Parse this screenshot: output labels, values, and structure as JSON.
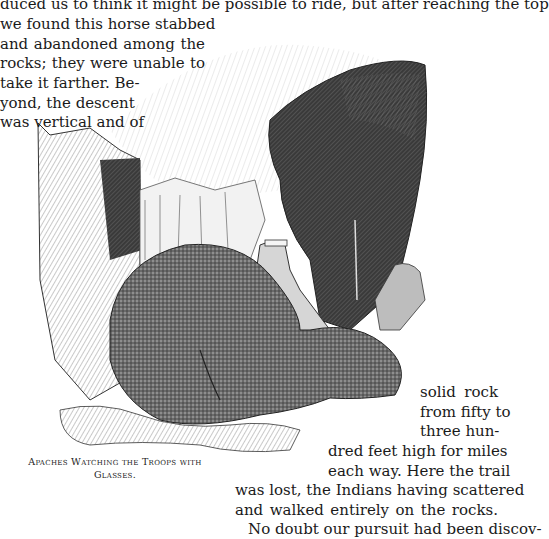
{
  "page": {
    "text_lines": [
      {
        "text": "duced us to think it might be possible to ride, but after reaching the top",
        "x": 0,
        "y": -6,
        "w": 498
      },
      {
        "text": "we found this horse stabbed",
        "x": 0,
        "y": 14,
        "w": 205
      },
      {
        "text": "and abandoned among the",
        "x": 0,
        "y": 34,
        "w": 205
      },
      {
        "text": "rocks; they were unable to",
        "x": 0,
        "y": 53,
        "w": 205
      },
      {
        "text": "take it farther. Be-",
        "x": 0,
        "y": 73,
        "w": 128
      },
      {
        "text": "yond, the descent",
        "x": 0,
        "y": 93,
        "w": 128
      },
      {
        "text": "was vertical and of",
        "x": 0,
        "y": 112,
        "w": 128
      },
      {
        "text": "solid rock",
        "x": 420,
        "y": 382,
        "w": 78
      },
      {
        "text": "from fifty to",
        "x": 420,
        "y": 402,
        "w": 78
      },
      {
        "text": "three hun-",
        "x": 420,
        "y": 421,
        "w": 78
      },
      {
        "text": "dred feet high for miles",
        "x": 328,
        "y": 441,
        "w": 170
      },
      {
        "text": "each way. Here the trail",
        "x": 328,
        "y": 461,
        "w": 170
      },
      {
        "text": "was lost, the Indians having scattered",
        "x": 235,
        "y": 480,
        "w": 263
      },
      {
        "text": "and walked entirely on the rocks.",
        "x": 235,
        "y": 500,
        "w": 263
      },
      {
        "text": "No doubt our pursuit had been discov-",
        "x": 248,
        "y": 519,
        "w": 250
      }
    ],
    "caption": {
      "line1": "Apaches Watching the Troops with",
      "line2": "Glasses."
    }
  }
}
